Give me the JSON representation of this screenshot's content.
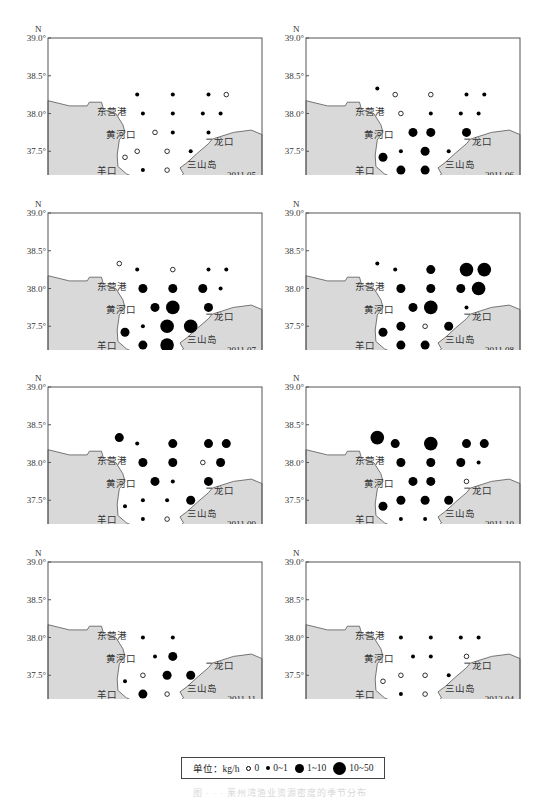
{
  "chart_data": {
    "type": "scatter",
    "subtype": "bubble-map-small-multiples",
    "title": "",
    "xlabel": "E",
    "ylabel": "N",
    "xlim": [
      118.0,
      121.0
    ],
    "ylim": [
      37.0,
      39.0
    ],
    "xticks": [
      "118.0°",
      "118.5°",
      "119.0°",
      "119.5°",
      "120.0°",
      "120.5°",
      "121.0°E"
    ],
    "yticks": [
      "37.0°",
      "37.5°",
      "38.0°",
      "38.5°",
      "39.0°"
    ],
    "y_axis_title": "N",
    "grid": false,
    "place_labels": [
      "东营港",
      "黄河口",
      "羊口",
      "下营",
      "三山岛",
      "龙口"
    ],
    "size_classes": [
      {
        "code": 0,
        "label": "0",
        "style": "open"
      },
      {
        "code": 1,
        "label": "0~1",
        "style": "filled-small"
      },
      {
        "code": 2,
        "label": "1~10",
        "style": "filled-medium"
      },
      {
        "code": 3,
        "label": "10~50",
        "style": "filled-large"
      }
    ],
    "legend": {
      "unit_label": "单位：kg/h",
      "position": "bottom-center"
    },
    "panels": [
      {
        "label": "2011.05",
        "points": [
          [
            119.25,
            38.25,
            1
          ],
          [
            119.75,
            38.25,
            1
          ],
          [
            120.25,
            38.25,
            1
          ],
          [
            120.5,
            38.25,
            0
          ],
          [
            119.33,
            38.0,
            1
          ],
          [
            119.75,
            38.0,
            1
          ],
          [
            120.17,
            38.0,
            1
          ],
          [
            120.42,
            38.0,
            1
          ],
          [
            119.5,
            37.75,
            0
          ],
          [
            119.75,
            37.75,
            1
          ],
          [
            120.25,
            37.75,
            1
          ],
          [
            119.25,
            37.5,
            0
          ],
          [
            119.67,
            37.5,
            0
          ],
          [
            120.0,
            37.5,
            1
          ],
          [
            119.08,
            37.42,
            0
          ],
          [
            119.33,
            37.25,
            1
          ],
          [
            119.67,
            37.25,
            0
          ]
        ]
      },
      {
        "label": "2011.06",
        "points": [
          [
            119.0,
            38.33,
            1
          ],
          [
            119.25,
            38.25,
            0
          ],
          [
            119.75,
            38.25,
            0
          ],
          [
            120.25,
            38.25,
            1
          ],
          [
            120.5,
            38.25,
            1
          ],
          [
            119.33,
            38.0,
            0
          ],
          [
            119.75,
            38.0,
            1
          ],
          [
            120.17,
            38.0,
            1
          ],
          [
            120.42,
            38.0,
            1
          ],
          [
            119.5,
            37.75,
            2
          ],
          [
            119.75,
            37.75,
            2
          ],
          [
            120.25,
            37.75,
            2
          ],
          [
            119.33,
            37.5,
            1
          ],
          [
            119.67,
            37.5,
            2
          ],
          [
            120.0,
            37.5,
            1
          ],
          [
            119.08,
            37.42,
            2
          ],
          [
            119.33,
            37.25,
            2
          ],
          [
            119.67,
            37.25,
            2
          ]
        ]
      },
      {
        "label": "2011.07",
        "points": [
          [
            119.0,
            38.33,
            0
          ],
          [
            119.25,
            38.25,
            1
          ],
          [
            119.75,
            38.25,
            0
          ],
          [
            120.25,
            38.25,
            1
          ],
          [
            120.5,
            38.25,
            1
          ],
          [
            119.33,
            38.0,
            2
          ],
          [
            119.75,
            38.0,
            2
          ],
          [
            120.17,
            38.0,
            2
          ],
          [
            120.42,
            38.0,
            1
          ],
          [
            119.5,
            37.75,
            2
          ],
          [
            119.75,
            37.75,
            3
          ],
          [
            120.25,
            37.75,
            2
          ],
          [
            119.33,
            37.5,
            1
          ],
          [
            119.67,
            37.5,
            3
          ],
          [
            120.0,
            37.5,
            3
          ],
          [
            119.08,
            37.42,
            2
          ],
          [
            119.33,
            37.25,
            2
          ],
          [
            119.67,
            37.25,
            3
          ]
        ]
      },
      {
        "label": "2011.08",
        "points": [
          [
            119.0,
            38.33,
            1
          ],
          [
            119.25,
            38.25,
            1
          ],
          [
            119.75,
            38.25,
            2
          ],
          [
            120.25,
            38.25,
            3
          ],
          [
            120.5,
            38.25,
            3
          ],
          [
            119.33,
            38.0,
            2
          ],
          [
            119.75,
            38.0,
            2
          ],
          [
            120.17,
            38.0,
            2
          ],
          [
            120.42,
            38.0,
            3
          ],
          [
            119.5,
            37.75,
            2
          ],
          [
            119.75,
            37.75,
            3
          ],
          [
            120.25,
            37.75,
            1
          ],
          [
            119.33,
            37.5,
            2
          ],
          [
            119.67,
            37.5,
            0
          ],
          [
            120.0,
            37.5,
            2
          ],
          [
            119.08,
            37.42,
            2
          ],
          [
            119.33,
            37.25,
            2
          ],
          [
            119.67,
            37.25,
            2
          ]
        ]
      },
      {
        "label": "2011.09",
        "points": [
          [
            119.0,
            38.33,
            2
          ],
          [
            119.25,
            38.25,
            1
          ],
          [
            119.75,
            38.25,
            2
          ],
          [
            120.25,
            38.25,
            2
          ],
          [
            120.5,
            38.25,
            2
          ],
          [
            119.33,
            38.0,
            2
          ],
          [
            119.75,
            38.0,
            2
          ],
          [
            120.17,
            38.0,
            0
          ],
          [
            120.42,
            38.0,
            2
          ],
          [
            119.5,
            37.75,
            2
          ],
          [
            119.75,
            37.75,
            1
          ],
          [
            120.25,
            37.75,
            2
          ],
          [
            119.33,
            37.5,
            1
          ],
          [
            119.67,
            37.5,
            1
          ],
          [
            120.0,
            37.5,
            2
          ],
          [
            119.08,
            37.42,
            1
          ],
          [
            119.33,
            37.25,
            1
          ],
          [
            119.67,
            37.25,
            0
          ]
        ]
      },
      {
        "label": "2011.10",
        "points": [
          [
            119.0,
            38.33,
            3
          ],
          [
            119.25,
            38.25,
            2
          ],
          [
            119.75,
            38.25,
            3
          ],
          [
            120.25,
            38.25,
            2
          ],
          [
            120.5,
            38.25,
            2
          ],
          [
            119.33,
            38.0,
            2
          ],
          [
            119.75,
            38.0,
            2
          ],
          [
            120.17,
            38.0,
            2
          ],
          [
            120.42,
            38.0,
            1
          ],
          [
            119.5,
            37.75,
            2
          ],
          [
            119.75,
            37.75,
            2
          ],
          [
            120.25,
            37.75,
            0
          ],
          [
            119.33,
            37.5,
            2
          ],
          [
            119.67,
            37.5,
            2
          ],
          [
            120.0,
            37.5,
            2
          ],
          [
            119.08,
            37.42,
            2
          ],
          [
            119.33,
            37.25,
            1
          ],
          [
            119.67,
            37.25,
            1
          ]
        ]
      },
      {
        "label": "2011.11",
        "points": [
          [
            119.33,
            38.0,
            1
          ],
          [
            119.75,
            38.0,
            1
          ],
          [
            119.5,
            37.75,
            1
          ],
          [
            119.75,
            37.75,
            2
          ],
          [
            119.33,
            37.5,
            0
          ],
          [
            119.67,
            37.5,
            2
          ],
          [
            120.0,
            37.5,
            2
          ],
          [
            119.08,
            37.42,
            1
          ],
          [
            119.33,
            37.25,
            2
          ],
          [
            119.67,
            37.25,
            0
          ]
        ]
      },
      {
        "label": "2012.04",
        "points": [
          [
            119.33,
            38.0,
            1
          ],
          [
            119.75,
            38.0,
            1
          ],
          [
            120.17,
            38.0,
            1
          ],
          [
            120.42,
            38.0,
            1
          ],
          [
            119.5,
            37.75,
            1
          ],
          [
            119.75,
            37.75,
            1
          ],
          [
            120.25,
            37.75,
            0
          ],
          [
            119.33,
            37.5,
            0
          ],
          [
            119.67,
            37.5,
            0
          ],
          [
            120.0,
            37.5,
            1
          ],
          [
            119.08,
            37.42,
            0
          ],
          [
            119.33,
            37.25,
            1
          ],
          [
            119.67,
            37.25,
            0
          ]
        ]
      }
    ]
  },
  "legend": {
    "unit_label": "单位：kg/h",
    "items": [
      {
        "label": "0",
        "style": "open"
      },
      {
        "label": "0~1",
        "style": "small"
      },
      {
        "label": "1~10",
        "style": "medium"
      },
      {
        "label": "10~50",
        "style": "large"
      }
    ]
  },
  "caption": "图 · · · 莱州湾渔业资源密度的季节分布",
  "colors": {
    "land": "#d9d9d9",
    "coast": "#555555",
    "frame": "#555555",
    "dot": "#000000"
  }
}
